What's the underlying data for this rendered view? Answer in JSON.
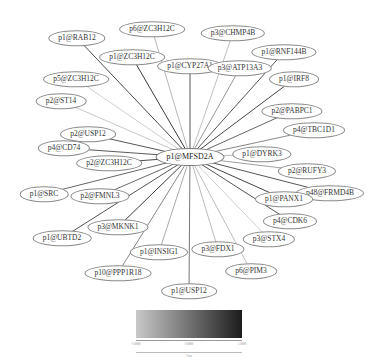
{
  "diagram": {
    "type": "star-network",
    "hub": {
      "id": "hub",
      "label": "p1@MFSD2A",
      "x": 190,
      "y": 157
    },
    "edge_color_range": [
      "#d8d8d8",
      "#2a2a2a"
    ],
    "nodes": [
      {
        "label": "p1@RAB12",
        "x": 77,
        "y": 38,
        "shade": "#4a4a4a"
      },
      {
        "label": "p6@ZC3H12C",
        "x": 152,
        "y": 29,
        "shade": "#b8b8b8"
      },
      {
        "label": "p3@CHMP4B",
        "x": 233,
        "y": 33,
        "shade": "#c0c0c0"
      },
      {
        "label": "p1@ZC3H12C",
        "x": 132,
        "y": 57,
        "shade": "#3a3a3a"
      },
      {
        "label": "p1@CYP27A1",
        "x": 190,
        "y": 66,
        "shade": "#555555"
      },
      {
        "label": "p3@ATP13A3",
        "x": 240,
        "y": 68,
        "shade": "#999999"
      },
      {
        "label": "p1@RNF144B",
        "x": 284,
        "y": 52,
        "shade": "#555555"
      },
      {
        "label": "p1@IRF8",
        "x": 294,
        "y": 79,
        "shade": "#444444"
      },
      {
        "label": "p5@ZC3H12C",
        "x": 76,
        "y": 79,
        "shade": "#d0d0d0"
      },
      {
        "label": "p2@ST14",
        "x": 61,
        "y": 101,
        "shade": "#c8c8c8"
      },
      {
        "label": "p2@PABPC1",
        "x": 292,
        "y": 111,
        "shade": "#666666"
      },
      {
        "label": "p4@TBC1D1",
        "x": 314,
        "y": 130,
        "shade": "#888888"
      },
      {
        "label": "p2@USP12",
        "x": 88,
        "y": 134,
        "shade": "#555555"
      },
      {
        "label": "p4@CD74",
        "x": 64,
        "y": 148,
        "shade": "#5a5a5a"
      },
      {
        "label": "p2@ZC3H12C",
        "x": 109,
        "y": 163,
        "shade": "#4a4a4a"
      },
      {
        "label": "p1@DYRK3",
        "x": 262,
        "y": 154,
        "shade": "#bbbbbb"
      },
      {
        "label": "p2@RUFY3",
        "x": 307,
        "y": 171,
        "shade": "#a0a0a0"
      },
      {
        "label": "p1@SRC",
        "x": 44,
        "y": 194,
        "shade": "#666666"
      },
      {
        "label": "p2@FMNL3",
        "x": 100,
        "y": 196,
        "shade": "#6a6a6a"
      },
      {
        "label": "p48@FRMD4B",
        "x": 330,
        "y": 193,
        "shade": "#555555"
      },
      {
        "label": "p1@PANX1",
        "x": 284,
        "y": 199,
        "shade": "#444444"
      },
      {
        "label": "p3@MKNK1",
        "x": 118,
        "y": 227,
        "shade": "#3a3a3a"
      },
      {
        "label": "p4@CDK6",
        "x": 290,
        "y": 221,
        "shade": "#555555"
      },
      {
        "label": "p1@UBTD2",
        "x": 62,
        "y": 238,
        "shade": "#555555"
      },
      {
        "label": "p3@STX4",
        "x": 269,
        "y": 239,
        "shade": "#cfcfcf"
      },
      {
        "label": "p1@INSIG1",
        "x": 159,
        "y": 252,
        "shade": "#aaaaaa"
      },
      {
        "label": "p3@FDX1",
        "x": 218,
        "y": 249,
        "shade": "#bbbbbb"
      },
      {
        "label": "p6@PIM3",
        "x": 251,
        "y": 271,
        "shade": "#bdbdbd"
      },
      {
        "label": "p10@PPP1R18",
        "x": 118,
        "y": 273,
        "shade": "#888888"
      },
      {
        "label": "p1@USP12",
        "x": 189,
        "y": 291,
        "shade": "#777777"
      }
    ]
  },
  "legend": {
    "ticks": [
      "-1.0000",
      "0.0000",
      "1.0000"
    ],
    "title": "Corr"
  }
}
